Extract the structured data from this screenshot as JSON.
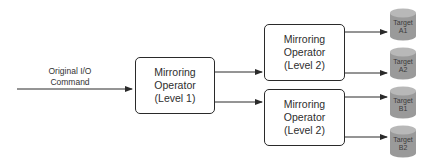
{
  "diagram": {
    "input": {
      "label_line1": "Original I/O",
      "label_line2": "Command"
    },
    "level1": {
      "line1": "Mirroring",
      "line2": "Operator",
      "line3": "(Level 1)"
    },
    "level2_top": {
      "line1": "Mirroring",
      "line2": "Operator",
      "line3": "(Level 2)"
    },
    "level2_bottom": {
      "line1": "Mirroring",
      "line2": "Operator",
      "line3": "(Level 2)"
    },
    "targets": [
      {
        "line1": "Target",
        "line2": "A1"
      },
      {
        "line1": "Target",
        "line2": "A2"
      },
      {
        "line1": "Target",
        "line2": "B1"
      },
      {
        "line1": "Target",
        "line2": "B2"
      }
    ],
    "colors": {
      "line": "#2a2a2a",
      "target_fill": "#9a9a9a",
      "target_top": "#b8b8b8",
      "text": "#2e2e2e"
    }
  }
}
